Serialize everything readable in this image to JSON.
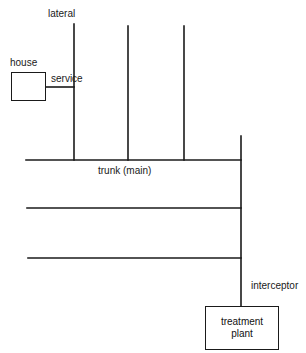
{
  "diagram": {
    "stroke_color": "#1a1a1a",
    "background": "#ffffff",
    "labels": {
      "lateral": "lateral",
      "house": "house",
      "service": "service",
      "trunk": "trunk (main)",
      "interceptor": "interceptor",
      "treatment_plant_line1": "treatment",
      "treatment_plant_line2": "plant"
    },
    "nodes": [
      {
        "id": "house",
        "label": "house",
        "type": "box"
      },
      {
        "id": "treatment-plant",
        "label": "treatment plant",
        "type": "box"
      }
    ],
    "edges": [
      {
        "from": "house",
        "to": "lateral-1",
        "label": "service"
      },
      {
        "from": "lateral-1",
        "to": "trunk",
        "label": "lateral"
      },
      {
        "from": "lateral-2",
        "to": "trunk",
        "label": ""
      },
      {
        "from": "lateral-3",
        "to": "trunk",
        "label": ""
      },
      {
        "from": "trunk",
        "to": "interceptor",
        "label": "trunk (main)"
      },
      {
        "from": "main-2",
        "to": "interceptor",
        "label": ""
      },
      {
        "from": "main-3",
        "to": "interceptor",
        "label": ""
      },
      {
        "from": "interceptor",
        "to": "treatment-plant",
        "label": "interceptor"
      }
    ]
  }
}
